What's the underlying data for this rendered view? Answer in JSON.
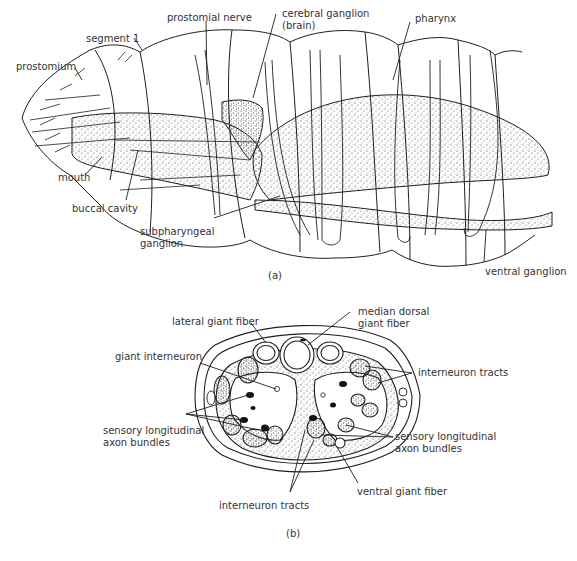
{
  "figure_a": {
    "caption": "(a)",
    "labels": {
      "prostomial_nerve": "prostomial nerve",
      "cerebral_ganglion_1": "cerebral ganglion",
      "cerebral_ganglion_2": "(brain)",
      "pharynx": "pharynx",
      "segment_1": "segment 1",
      "prostomium": "prostomium",
      "mouth": "mouth",
      "buccal_cavity": "buccal cavity",
      "subpharyngeal_1": "subpharyngeal",
      "subpharyngeal_2": "ganglion",
      "ventral_ganglion": "ventral ganglion"
    }
  },
  "figure_b": {
    "caption": "(b)",
    "labels": {
      "lateral_giant_fiber": "lateral giant fiber",
      "median_dorsal_1": "median dorsal",
      "median_dorsal_2": "giant fiber",
      "giant_interneuron": "giant interneuron",
      "interneuron_tracts_right": "interneuron tracts",
      "sensory_left_1": "sensory longitudinal",
      "sensory_left_2": "axon bundles",
      "sensory_right_1": "sensory longitudinal",
      "sensory_right_2": "axon bundles",
      "ventral_giant_fiber": "ventral giant fiber",
      "interneuron_tracts_bottom": "interneuron tracts"
    }
  },
  "colors": {
    "ink": "#1e1e1e",
    "text": "#333333",
    "background": "#ffffff"
  }
}
